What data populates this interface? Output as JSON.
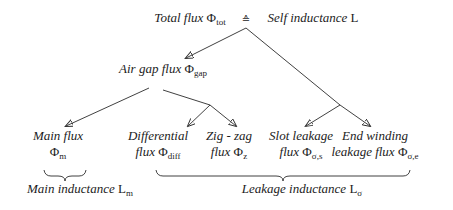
{
  "diagram": {
    "background_color": "#ffffff",
    "ink_color": "#2b2b2b",
    "nodes": [
      {
        "name": "total-flux-label",
        "x": 190,
        "y": 10,
        "lines": [
          [
            {
              "s": "i",
              "t": "Total flux "
            },
            {
              "s": "g",
              "t": "Φ"
            },
            {
              "s": "sub",
              "t": "tot"
            }
          ]
        ]
      },
      {
        "name": "corresponds-symbol",
        "x": 246,
        "y": 11,
        "lines": [
          [
            {
              "s": "sym",
              "t": "≙"
            }
          ]
        ]
      },
      {
        "name": "self-inductance-label",
        "x": 313,
        "y": 10,
        "lines": [
          [
            {
              "s": "i",
              "t": "Self inductance "
            },
            {
              "s": "r",
              "t": "L"
            }
          ]
        ]
      },
      {
        "name": "air-gap-flux-label",
        "x": 163,
        "y": 61,
        "lines": [
          [
            {
              "s": "i",
              "t": "Air gap flux "
            },
            {
              "s": "g",
              "t": "Φ"
            },
            {
              "s": "sub",
              "t": "gap"
            }
          ]
        ]
      },
      {
        "name": "main-flux-label",
        "x": 58,
        "y": 128,
        "lines": [
          [
            {
              "s": "i",
              "t": "Main flux"
            }
          ],
          [
            {
              "s": "g",
              "t": "Φ"
            },
            {
              "s": "sub",
              "t": "m"
            }
          ]
        ]
      },
      {
        "name": "differential-flux-label",
        "x": 158,
        "y": 128,
        "lines": [
          [
            {
              "s": "i",
              "t": "Differential"
            }
          ],
          [
            {
              "s": "i",
              "t": "flux "
            },
            {
              "s": "g",
              "t": "Φ"
            },
            {
              "s": "sub",
              "t": "diff"
            }
          ]
        ]
      },
      {
        "name": "zigzag-flux-label",
        "x": 229,
        "y": 128,
        "lines": [
          [
            {
              "s": "i",
              "t": "Zig - zag"
            }
          ],
          [
            {
              "s": "i",
              "t": "flux "
            },
            {
              "s": "g",
              "t": "Φ"
            },
            {
              "s": "sub",
              "t": "z"
            }
          ]
        ]
      },
      {
        "name": "slot-leakage-flux-label",
        "x": 301,
        "y": 128,
        "lines": [
          [
            {
              "s": "i",
              "t": "Slot leakage"
            }
          ],
          [
            {
              "s": "i",
              "t": "flux "
            },
            {
              "s": "g",
              "t": "Φ"
            },
            {
              "s": "sub",
              "t": "σ,s"
            }
          ]
        ]
      },
      {
        "name": "end-winding-flux-label",
        "x": 375,
        "y": 128,
        "lines": [
          [
            {
              "s": "i",
              "t": "End winding"
            }
          ],
          [
            {
              "s": "i",
              "t": "leakage flux "
            },
            {
              "s": "g",
              "t": "Φ"
            },
            {
              "s": "sub",
              "t": "σ,e"
            }
          ]
        ]
      },
      {
        "name": "main-inductance-label",
        "x": 80,
        "y": 181,
        "lines": [
          [
            {
              "s": "i",
              "t": "Main inductance "
            },
            {
              "s": "r",
              "t": "L"
            },
            {
              "s": "sub",
              "t": "m"
            }
          ]
        ]
      },
      {
        "name": "leakage-inductance-label",
        "x": 302,
        "y": 181,
        "lines": [
          [
            {
              "s": "i",
              "t": "Leakage inductance "
            },
            {
              "s": "r",
              "t": "L"
            },
            {
              "s": "sub",
              "t": "σ"
            }
          ]
        ]
      }
    ],
    "edges": [
      {
        "name": "arrow-root-to-airgap",
        "x1": 246,
        "y1": 28,
        "x2": 186,
        "y2": 58,
        "arrow": true
      },
      {
        "name": "line-root-to-right-junction",
        "x1": 246,
        "y1": 28,
        "x2": 340,
        "y2": 105,
        "arrow": false
      },
      {
        "name": "arrow-junction-to-slot-leakage",
        "x1": 340,
        "y1": 105,
        "x2": 306,
        "y2": 126,
        "arrow": true
      },
      {
        "name": "arrow-junction-to-end-winding",
        "x1": 340,
        "y1": 105,
        "x2": 370,
        "y2": 126,
        "arrow": true
      },
      {
        "name": "arrow-airgap-to-main-flux",
        "x1": 149,
        "y1": 88,
        "x2": 66,
        "y2": 126,
        "arrow": true
      },
      {
        "name": "line-airgap-to-mid-junction",
        "x1": 163,
        "y1": 90,
        "x2": 210,
        "y2": 105,
        "arrow": false
      },
      {
        "name": "arrow-junction-to-differential",
        "x1": 210,
        "y1": 105,
        "x2": 188,
        "y2": 126,
        "arrow": true
      },
      {
        "name": "arrow-junction-to-zigzag",
        "x1": 210,
        "y1": 105,
        "x2": 236,
        "y2": 126,
        "arrow": true
      }
    ],
    "braces": [
      {
        "name": "brace-main-inductance",
        "x1": 44,
        "x2": 86,
        "y": 170
      },
      {
        "name": "brace-leakage-inductance",
        "x1": 156,
        "x2": 410,
        "y": 170
      }
    ]
  }
}
